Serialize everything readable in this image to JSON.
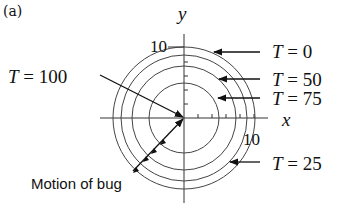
{
  "figure": {
    "panel_label": "(a)",
    "axes": {
      "x_label": "x",
      "y_label": "y",
      "x_tick_label": "10",
      "y_tick_label": "10"
    },
    "contours": [
      {
        "label": "T = 0",
        "var": "T",
        "value": "0",
        "radius_units": 10
      },
      {
        "label": "T = 25",
        "var": "T",
        "value": "25",
        "radius_units": 9
      },
      {
        "label": "T = 50",
        "var": "T",
        "value": "50",
        "radius_units": 7.5
      },
      {
        "label": "T = 75",
        "var": "T",
        "value": "75",
        "radius_units": 5
      }
    ],
    "center_label": {
      "var": "T",
      "value": "100"
    },
    "motion_caption": "Motion of bug",
    "colors": {
      "line": "#333333",
      "text": "#111111",
      "background": "#ffffff"
    }
  }
}
